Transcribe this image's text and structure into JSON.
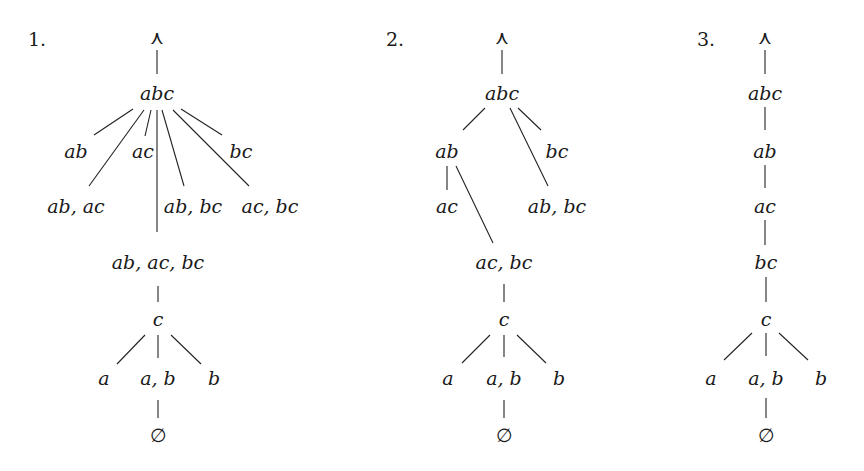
{
  "diagram": {
    "type": "lattice-trees",
    "trees": [
      {
        "number": "1.",
        "number_pos": [
          37,
          46
        ],
        "nodes": [
          {
            "id": "top",
            "label": "⋏",
            "x": 157,
            "y": 44,
            "italic": false
          },
          {
            "id": "abc",
            "label": "abc",
            "x": 157,
            "y": 100
          },
          {
            "id": "ab",
            "label": "ab",
            "x": 76,
            "y": 158
          },
          {
            "id": "ac",
            "label": "ac",
            "x": 143,
            "y": 158
          },
          {
            "id": "bc",
            "label": "bc",
            "x": 241,
            "y": 158
          },
          {
            "id": "ab_ac",
            "label": "ab, ac",
            "x": 76,
            "y": 213
          },
          {
            "id": "ab_bc",
            "label": "ab, bc",
            "x": 193,
            "y": 213
          },
          {
            "id": "ac_bc",
            "label": "ac, bc",
            "x": 270,
            "y": 213
          },
          {
            "id": "ab_ac_bc",
            "label": "ab, ac, bc",
            "x": 158,
            "y": 269
          },
          {
            "id": "c",
            "label": "c",
            "x": 158,
            "y": 326
          },
          {
            "id": "a",
            "label": "a",
            "x": 104,
            "y": 385
          },
          {
            "id": "a_b",
            "label": "a, b",
            "x": 158,
            "y": 385
          },
          {
            "id": "b",
            "label": "b",
            "x": 214,
            "y": 385
          },
          {
            "id": "empty",
            "label": "∅",
            "x": 158,
            "y": 442,
            "italic": false
          }
        ],
        "edges": [
          [
            157,
            50,
            157,
            74
          ],
          [
            133,
            109,
            94,
            135
          ],
          [
            144,
            110,
            89,
            186
          ],
          [
            151,
            110,
            145,
            136
          ],
          [
            157,
            110,
            157,
            232
          ],
          [
            162,
            110,
            184,
            186
          ],
          [
            173,
            110,
            249,
            186
          ],
          [
            181,
            109,
            222,
            135
          ],
          [
            158,
            286,
            158,
            302
          ],
          [
            145,
            335,
            117,
            364
          ],
          [
            158,
            335,
            158,
            358
          ],
          [
            171,
            335,
            201,
            364
          ],
          [
            158,
            400,
            158,
            418
          ]
        ]
      },
      {
        "number": "2.",
        "number_pos": [
          395,
          46
        ],
        "nodes": [
          {
            "id": "top",
            "label": "⋏",
            "x": 502,
            "y": 44,
            "italic": false
          },
          {
            "id": "abc",
            "label": "abc",
            "x": 502,
            "y": 100
          },
          {
            "id": "ab",
            "label": "ab",
            "x": 447,
            "y": 158
          },
          {
            "id": "bc",
            "label": "bc",
            "x": 557,
            "y": 158
          },
          {
            "id": "ac",
            "label": "ac",
            "x": 447,
            "y": 213
          },
          {
            "id": "ab_bc",
            "label": "ab, bc",
            "x": 557,
            "y": 213
          },
          {
            "id": "ac_bc",
            "label": "ac, bc",
            "x": 504,
            "y": 269
          },
          {
            "id": "c",
            "label": "c",
            "x": 504,
            "y": 326
          },
          {
            "id": "a",
            "label": "a",
            "x": 448,
            "y": 385
          },
          {
            "id": "a_b",
            "label": "a, b",
            "x": 504,
            "y": 385
          },
          {
            "id": "b",
            "label": "b",
            "x": 559,
            "y": 385
          },
          {
            "id": "empty",
            "label": "∅",
            "x": 504,
            "y": 442,
            "italic": false
          }
        ],
        "edges": [
          [
            502,
            50,
            502,
            74
          ],
          [
            485,
            108,
            463,
            130
          ],
          [
            510,
            108,
            548,
            186
          ],
          [
            518,
            108,
            541,
            130
          ],
          [
            447,
            166,
            447,
            190
          ],
          [
            456,
            166,
            493,
            243
          ],
          [
            504,
            284,
            504,
            302
          ],
          [
            490,
            335,
            462,
            363
          ],
          [
            504,
            335,
            504,
            357
          ],
          [
            517,
            335,
            546,
            363
          ],
          [
            504,
            400,
            504,
            418
          ]
        ]
      },
      {
        "number": "3.",
        "number_pos": [
          706,
          46
        ],
        "nodes": [
          {
            "id": "top",
            "label": "⋏",
            "x": 765,
            "y": 44,
            "italic": false
          },
          {
            "id": "abc",
            "label": "abc",
            "x": 765,
            "y": 100
          },
          {
            "id": "ab",
            "label": "ab",
            "x": 765,
            "y": 158
          },
          {
            "id": "ac",
            "label": "ac",
            "x": 765,
            "y": 213
          },
          {
            "id": "bc",
            "label": "bc",
            "x": 766,
            "y": 269
          },
          {
            "id": "c",
            "label": "c",
            "x": 766,
            "y": 326
          },
          {
            "id": "a",
            "label": "a",
            "x": 711,
            "y": 385
          },
          {
            "id": "a_b",
            "label": "a, b",
            "x": 766,
            "y": 385
          },
          {
            "id": "b",
            "label": "b",
            "x": 821,
            "y": 385
          },
          {
            "id": "empty",
            "label": "∅",
            "x": 766,
            "y": 442,
            "italic": false
          }
        ],
        "edges": [
          [
            765,
            50,
            765,
            74
          ],
          [
            765,
            107,
            765,
            130
          ],
          [
            765,
            165,
            765,
            188
          ],
          [
            765,
            220,
            765,
            245
          ],
          [
            766,
            277,
            766,
            302
          ],
          [
            752,
            333,
            724,
            360
          ],
          [
            766,
            333,
            766,
            356
          ],
          [
            779,
            333,
            808,
            360
          ],
          [
            766,
            398,
            766,
            418
          ]
        ]
      }
    ]
  }
}
